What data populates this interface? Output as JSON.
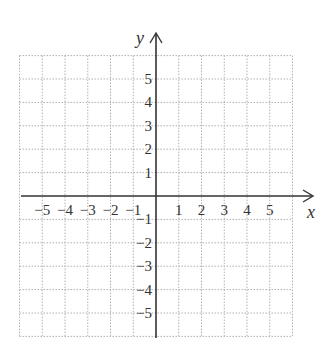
{
  "chart_data": {
    "type": "scatter",
    "title": "",
    "xlabel": "x",
    "ylabel": "y",
    "xlim": [
      -6,
      6
    ],
    "ylim": [
      -6,
      6
    ],
    "grid": true,
    "grid_style": "dotted",
    "x_ticks": [
      "-5",
      "-4",
      "-3",
      "-2",
      "-1",
      "1",
      "2",
      "3",
      "4",
      "5"
    ],
    "y_ticks": [
      "5",
      "4",
      "3",
      "2",
      "1",
      "-1",
      "-2",
      "-3",
      "-4",
      "-5"
    ],
    "series": []
  },
  "colors": {
    "axis": "#333333",
    "grid": "#b0b0b0"
  }
}
